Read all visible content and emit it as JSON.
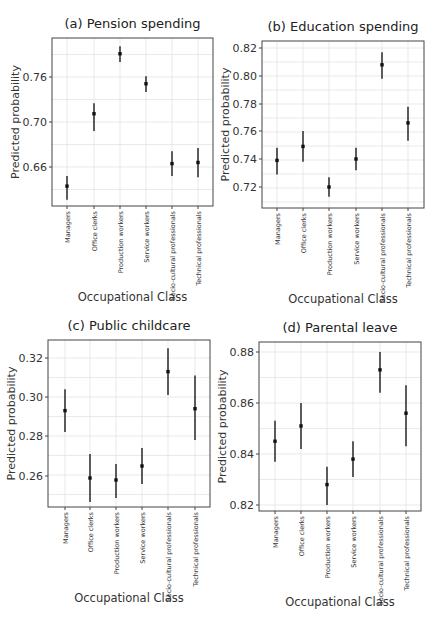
{
  "figure": {
    "x_axis_label": "Occupational Class",
    "y_axis_label": "Predicted probability",
    "categories": [
      "Managers",
      "Office clerks",
      "Production workers",
      "Service workers",
      "Socio-cultural professionals",
      "Technical professionals"
    ]
  },
  "chart_data": [
    {
      "type": "scatter",
      "subtype": "point-with-errorbars",
      "title": "(a) Pension spending",
      "xlabel": "Occupational Class",
      "ylabel": "Predicted probability",
      "categories": [
        "Managers",
        "Office clerks",
        "Production workers",
        "Service workers",
        "Socio-cultural professionals",
        "Technical professionals"
      ],
      "values": [
        0.643,
        0.711,
        0.791,
        0.751,
        0.663,
        0.664
      ],
      "ci_lower": [
        0.631,
        0.692,
        0.78,
        0.74,
        0.652,
        0.651
      ],
      "ci_upper": [
        0.652,
        0.725,
        0.801,
        0.761,
        0.674,
        0.677
      ],
      "yticks": [
        0.66,
        0.7,
        0.76
      ],
      "ytick_pixels": [
        167,
        122,
        77
      ],
      "ylim": [
        0.625,
        0.805
      ],
      "grid": true,
      "box": {
        "x": 52,
        "y": 38,
        "w": 161,
        "h": 168
      },
      "xpos": [
        67,
        94,
        120,
        146,
        172,
        198
      ]
    },
    {
      "type": "scatter",
      "subtype": "point-with-errorbars",
      "title": "(b) Education spending",
      "xlabel": "Occupational Class",
      "ylabel": "Predicted probability",
      "categories": [
        "Managers",
        "Office clerks",
        "Production workers",
        "Service workers",
        "Socio-cultural professionals",
        "Technical professionals"
      ],
      "values": [
        0.739,
        0.749,
        0.72,
        0.74,
        0.808,
        0.766
      ],
      "ci_lower": [
        0.729,
        0.738,
        0.713,
        0.732,
        0.798,
        0.753
      ],
      "ci_upper": [
        0.748,
        0.76,
        0.727,
        0.748,
        0.817,
        0.778
      ],
      "yticks": [
        0.72,
        0.74,
        0.76,
        0.78,
        0.8,
        0.82
      ],
      "ytick_pixels": [
        187,
        159,
        131,
        104,
        76,
        48
      ],
      "ylim": [
        0.705,
        0.825
      ],
      "grid": true,
      "box": {
        "x": 262,
        "y": 41,
        "w": 162,
        "h": 167
      },
      "xpos": [
        277,
        303,
        329,
        356,
        382,
        408
      ]
    },
    {
      "type": "scatter",
      "subtype": "point-with-errorbars",
      "title": "(c) Public childcare",
      "xlabel": "Occupational Class",
      "ylabel": "Predicted probability",
      "categories": [
        "Managers",
        "Office clerks",
        "Production workers",
        "Service workers",
        "Socio-cultural professionals",
        "Technical professionals"
      ],
      "values": [
        0.293,
        0.259,
        0.258,
        0.265,
        0.313,
        0.294
      ],
      "ci_lower": [
        0.282,
        0.247,
        0.249,
        0.256,
        0.301,
        0.278
      ],
      "ci_upper": [
        0.304,
        0.271,
        0.266,
        0.274,
        0.325,
        0.311
      ],
      "yticks": [
        0.26,
        0.28,
        0.3,
        0.32
      ],
      "ytick_pixels": [
        476,
        436,
        397,
        358
      ],
      "ylim": [
        0.244,
        0.329
      ],
      "grid": true,
      "box": {
        "x": 48,
        "y": 340,
        "w": 162,
        "h": 167
      },
      "xpos": [
        65,
        90,
        116,
        142,
        168,
        195
      ]
    },
    {
      "type": "scatter",
      "subtype": "point-with-errorbars",
      "title": "(d) Parental leave",
      "xlabel": "Occupational Class",
      "ylabel": "Predicted probability",
      "categories": [
        "Managers",
        "Office clerks",
        "Production workers",
        "Service workers",
        "Socio-cultural professionals",
        "Technical professionals"
      ],
      "values": [
        0.845,
        0.851,
        0.828,
        0.838,
        0.873,
        0.856
      ],
      "ci_lower": [
        0.837,
        0.842,
        0.82,
        0.831,
        0.864,
        0.843
      ],
      "ci_upper": [
        0.853,
        0.86,
        0.835,
        0.845,
        0.88,
        0.867
      ],
      "yticks": [
        0.82,
        0.84,
        0.86,
        0.88
      ],
      "ytick_pixels": [
        505,
        454,
        403,
        352
      ],
      "ylim": [
        0.818,
        0.884
      ],
      "grid": true,
      "box": {
        "x": 259,
        "y": 342,
        "w": 162,
        "h": 169
      },
      "xpos": [
        275,
        301,
        327,
        353,
        380,
        406
      ]
    }
  ]
}
